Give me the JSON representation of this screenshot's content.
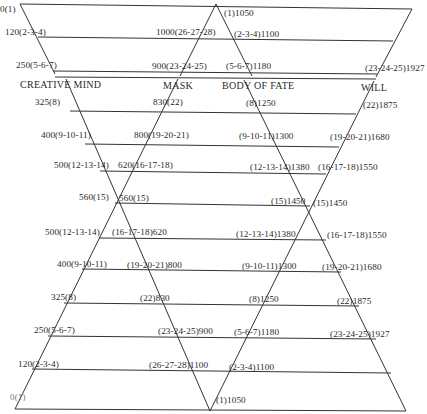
{
  "diagram": {
    "headers": {
      "creative_mind": "CREATIVE MIND",
      "mask": "MASK",
      "body_of_fate": "BODY OF FATE",
      "will": "WILL"
    },
    "top_section": [
      {
        "left": "0(1)",
        "right": "(1)1050"
      },
      {
        "left": "120(2-3-4)",
        "mid_left": "1000(26-27-28)",
        "mid_right": "(2-3-4)1100"
      },
      {
        "left": "250(5-6-7)",
        "mid_left": "900(23-24-25)",
        "mid_right": "(5-6-7)1180",
        "right": "(23-24-25)1927"
      }
    ],
    "rows": [
      {
        "a": "325(8)",
        "b": "830(22)",
        "c": "(8)1250",
        "d": "(22)1875"
      },
      {
        "a": "400(9-10-11)",
        "b": "800(19-20-21)",
        "c": "(9-10-11)1300",
        "d": "(19-20-21)1680"
      },
      {
        "a": "500(12-13-14)",
        "b": "620(16-17-18)",
        "c": "(12-13-14)1380",
        "d": "(16-17-18)1550"
      },
      {
        "a": "560(15)",
        "b": "560(15)",
        "c": "(15)1450",
        "d": "(15)1450"
      },
      {
        "a": "500(12-13-14)",
        "b": "(16-17-18)620",
        "c": "(12-13-14)1380",
        "d": "(16-17-18)1550"
      },
      {
        "a": "400(9-10-11)",
        "b": "(19-20-21)800",
        "c": "(9-10-11)1300",
        "d": "(19-20-21)1680"
      },
      {
        "a": "325(8)",
        "b": "(22)830",
        "c": "(8)1250",
        "d": "(22)1875"
      },
      {
        "a": "250(5-6-7)",
        "b": "(23-24-25)900",
        "c": "(5-6-7)1180",
        "d": "(23-24-25)1927"
      },
      {
        "a": "120(2-3-4)",
        "b": "(26-27-28)1100",
        "c": "(2-3-4)1100"
      },
      {
        "a": "0(1)",
        "c": "(1)1050"
      }
    ]
  }
}
